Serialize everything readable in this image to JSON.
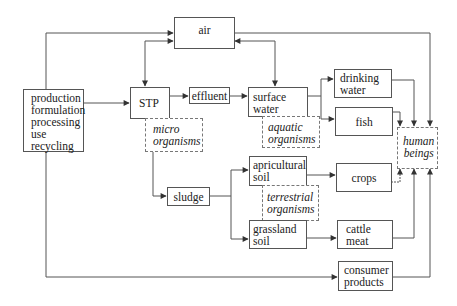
{
  "diagram": {
    "nodes": {
      "production": {
        "lines": [
          "production",
          "formulation",
          "processing",
          "use",
          "recycling"
        ],
        "text": "production\nformulation\nprocessing\nuse\nrecycling"
      },
      "air": {
        "text": "air"
      },
      "stp": {
        "text": "STP"
      },
      "effluent": {
        "text": "effluent"
      },
      "micro_organisms": {
        "text": "micro\norganisms"
      },
      "surface_water": {
        "text": "surface\nwater"
      },
      "aquatic_organisms": {
        "text": "aquatic\norganisms"
      },
      "drinking_water": {
        "text": "drinking\nwater"
      },
      "fish": {
        "text": "fish"
      },
      "human_beings": {
        "text": "human\nbeings"
      },
      "sludge": {
        "text": "sludge"
      },
      "apricultural_soil": {
        "text": "apricultural\nsoil"
      },
      "terrestrial_organisms": {
        "text": "terrestrial\norganisms"
      },
      "grassland_soil": {
        "text": "grassland\nsoil"
      },
      "crops": {
        "text": "crops"
      },
      "cattle_meat": {
        "text": "cattle\nmeat"
      },
      "consumer_products": {
        "text": "consumer\nproducts"
      }
    },
    "edges": [
      {
        "from": "production",
        "to": "air"
      },
      {
        "from": "production",
        "to": "stp"
      },
      {
        "from": "production",
        "to": "consumer_products"
      },
      {
        "from": "stp",
        "to": "air",
        "bidirectional": true
      },
      {
        "from": "air",
        "to": "surface_water",
        "bidirectional": true
      },
      {
        "from": "air",
        "to": "human_beings"
      },
      {
        "from": "stp",
        "to": "effluent"
      },
      {
        "from": "effluent",
        "to": "surface_water"
      },
      {
        "from": "surface_water",
        "to": "drinking_water"
      },
      {
        "from": "surface_water",
        "to": "fish"
      },
      {
        "from": "drinking_water",
        "to": "human_beings"
      },
      {
        "from": "fish",
        "to": "human_beings"
      },
      {
        "from": "micro_organisms",
        "to": "sludge"
      },
      {
        "from": "sludge",
        "to": "apricultural_soil"
      },
      {
        "from": "sludge",
        "to": "grassland_soil"
      },
      {
        "from": "apricultural_soil",
        "to": "crops"
      },
      {
        "from": "grassland_soil",
        "to": "cattle_meat"
      },
      {
        "from": "crops",
        "to": "human_beings"
      },
      {
        "from": "cattle_meat",
        "to": "human_beings"
      },
      {
        "from": "consumer_products",
        "to": "human_beings"
      }
    ],
    "colors": {
      "line": "#555555",
      "box_border": "#555555",
      "dashed_border": "#777777",
      "text": "#222222"
    }
  }
}
